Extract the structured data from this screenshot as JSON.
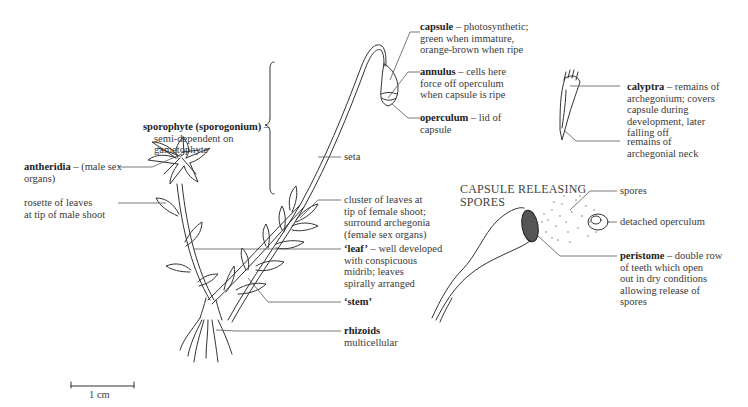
{
  "diagram": {
    "type": "moss plant (Funaria) labelled diagram",
    "scale_bar": {
      "label": "1 cm"
    },
    "section_titles": {
      "capsule_releasing": [
        "CAPSULE RELEASING",
        "SPORES"
      ]
    },
    "labels": {
      "capsule": {
        "term": "capsule",
        "sep": " – ",
        "lines": [
          "photosynthetic;",
          "green when immature,",
          "orange-brown when ripe"
        ]
      },
      "annulus": {
        "term": "annulus",
        "sep": " – ",
        "lines": [
          "cells here",
          "force off operculum",
          "when capsule is ripe"
        ]
      },
      "operculum": {
        "term": "operculum",
        "sep": " – ",
        "lines": [
          "lid of",
          "capsule"
        ]
      },
      "calyptra": {
        "term": "calyptra",
        "sep": " – ",
        "lines": [
          "remains of",
          "archegonium; covers",
          "capsule during",
          "development, later",
          "falling off"
        ]
      },
      "archegonial_neck": {
        "lines": [
          "remains of",
          "archegonial neck"
        ]
      },
      "sporophyte": {
        "term": "sporophyte (sporogonium)",
        "sep": " –",
        "lines": [
          "semi-dependent on",
          "gametophyte"
        ]
      },
      "antheridia": {
        "term": "antheridia",
        "sep": " – ",
        "lines": [
          "(male sex",
          "organs)"
        ]
      },
      "rosette": {
        "lines": [
          "rosette of leaves",
          "at tip of male shoot"
        ]
      },
      "seta": {
        "lines": [
          "seta"
        ]
      },
      "cluster": {
        "lines": [
          "cluster of leaves at",
          "tip of female shoot;",
          "surround archegonia",
          "(female sex organs)"
        ]
      },
      "leaf": {
        "term": "‘leaf’",
        "sep": " – ",
        "lines": [
          "well developed",
          "with conspicuous",
          "midrib; leaves",
          "spirally arranged"
        ]
      },
      "stem": {
        "term": "‘stem’"
      },
      "rhizoids": {
        "term": "rhizoids",
        "lines": [
          "multicellular"
        ]
      },
      "spores": {
        "lines": [
          "spores"
        ]
      },
      "detached_operculum": {
        "lines": [
          "detached operculum"
        ]
      },
      "peristome": {
        "term": "peristome",
        "sep": " – ",
        "lines": [
          "double row",
          "of teeth which open",
          "out in dry conditions",
          "allowing release of",
          "spores"
        ]
      }
    }
  }
}
